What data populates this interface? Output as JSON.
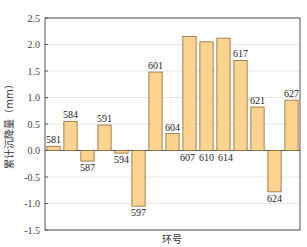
{
  "chart_data": {
    "type": "bar",
    "title": "",
    "xlabel": "环号",
    "ylabel": "累计沉降量（mm）",
    "ylim": [
      -1.5,
      2.5
    ],
    "yticks": [
      "2.5",
      "2.0",
      "1.5",
      "1.0",
      "0.5",
      "0.0",
      "-0.5",
      "-1.0",
      "-1.5"
    ],
    "grid": true,
    "categories": [
      "581",
      "584",
      "587",
      "591",
      "594",
      "597",
      "601",
      "604",
      "607",
      "610",
      "614",
      "617",
      "621",
      "624",
      "627"
    ],
    "values": [
      0.08,
      0.55,
      -0.2,
      0.48,
      -0.05,
      -1.05,
      1.48,
      0.32,
      2.15,
      2.05,
      2.12,
      1.7,
      0.82,
      -0.78,
      0.95
    ],
    "bar_color": "#FCD38F",
    "bar_edge": "#8a6a3a"
  }
}
